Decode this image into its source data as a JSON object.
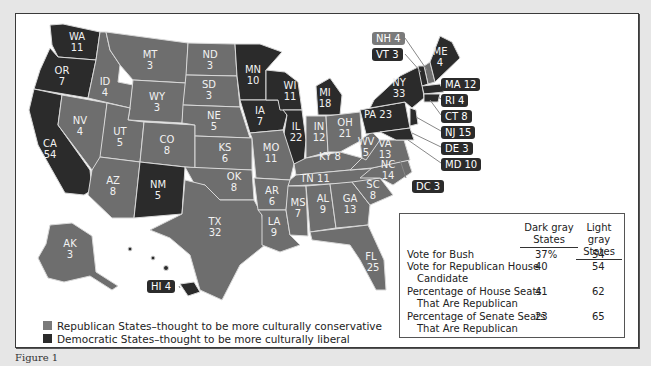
{
  "legend": {
    "republican": {
      "label": "Republican States–thought to be more culturally conservative",
      "color": "#6e6e6e"
    },
    "democratic": {
      "label": "Democratic States–thought to be more culturally liberal",
      "color": "#2b2b2b"
    }
  },
  "states": {
    "WA": {
      "abbr": "WA",
      "ev": "11",
      "party": "D"
    },
    "OR": {
      "abbr": "OR",
      "ev": "7",
      "party": "D"
    },
    "CA": {
      "abbr": "CA",
      "ev": "54",
      "party": "D"
    },
    "ID": {
      "abbr": "ID",
      "ev": "4",
      "party": "R"
    },
    "NV": {
      "abbr": "NV",
      "ev": "4",
      "party": "R"
    },
    "MT": {
      "abbr": "MT",
      "ev": "3",
      "party": "R"
    },
    "WY": {
      "abbr": "WY",
      "ev": "3",
      "party": "R"
    },
    "UT": {
      "abbr": "UT",
      "ev": "5",
      "party": "R"
    },
    "AZ": {
      "abbr": "AZ",
      "ev": "8",
      "party": "R"
    },
    "CO": {
      "abbr": "CO",
      "ev": "8",
      "party": "R"
    },
    "NM": {
      "abbr": "NM",
      "ev": "5",
      "party": "D"
    },
    "ND": {
      "abbr": "ND",
      "ev": "3",
      "party": "R"
    },
    "SD": {
      "abbr": "SD",
      "ev": "3",
      "party": "R"
    },
    "NE": {
      "abbr": "NE",
      "ev": "5",
      "party": "R"
    },
    "KS": {
      "abbr": "KS",
      "ev": "6",
      "party": "R"
    },
    "OK": {
      "abbr": "OK",
      "ev": "8",
      "party": "R"
    },
    "TX": {
      "abbr": "TX",
      "ev": "32",
      "party": "R"
    },
    "MN": {
      "abbr": "MN",
      "ev": "10",
      "party": "D"
    },
    "IA": {
      "abbr": "IA",
      "ev": "7",
      "party": "D"
    },
    "MO": {
      "abbr": "MO",
      "ev": "11",
      "party": "R"
    },
    "AR": {
      "abbr": "AR",
      "ev": "6",
      "party": "R"
    },
    "LA": {
      "abbr": "LA",
      "ev": "9",
      "party": "R"
    },
    "WI": {
      "abbr": "WI",
      "ev": "11",
      "party": "D"
    },
    "IL": {
      "abbr": "IL",
      "ev": "22",
      "party": "D"
    },
    "MI": {
      "abbr": "MI",
      "ev": "18",
      "party": "D"
    },
    "IN": {
      "abbr": "IN",
      "ev": "12",
      "party": "R"
    },
    "OH": {
      "abbr": "OH",
      "ev": "21",
      "party": "R"
    },
    "KY": {
      "abbr": "KY",
      "ev": "8",
      "party": "R"
    },
    "TN": {
      "abbr": "TN",
      "ev": "11",
      "party": "R"
    },
    "MS": {
      "abbr": "MS",
      "ev": "7",
      "party": "R"
    },
    "AL": {
      "abbr": "AL",
      "ev": "9",
      "party": "R"
    },
    "GA": {
      "abbr": "GA",
      "ev": "13",
      "party": "R"
    },
    "FL": {
      "abbr": "FL",
      "ev": "25",
      "party": "R"
    },
    "SC": {
      "abbr": "SC",
      "ev": "8",
      "party": "R"
    },
    "NC": {
      "abbr": "NC",
      "ev": "14",
      "party": "R"
    },
    "VA": {
      "abbr": "VA",
      "ev": "13",
      "party": "R"
    },
    "WV": {
      "abbr": "WV",
      "ev": "5",
      "party": "R"
    },
    "PA": {
      "abbr": "PA",
      "ev": "23",
      "party": "D"
    },
    "NY": {
      "abbr": "NY",
      "ev": "33",
      "party": "D"
    },
    "ME": {
      "abbr": "ME",
      "ev": "4",
      "party": "D"
    },
    "AK": {
      "abbr": "AK",
      "ev": "3",
      "party": "R"
    }
  },
  "callouts": {
    "NH": "NH  4",
    "VT": "VT  3",
    "MA": "MA 12",
    "RI": "RI   4",
    "CT": "CT  8",
    "NJ": "NJ  15",
    "DE": "DE  3",
    "MD": "MD 10",
    "DC": "DC  3",
    "HI": "HI  4"
  },
  "table": {
    "col1": [
      "Dark gray",
      "States"
    ],
    "col2": [
      "Light gray",
      "States"
    ],
    "rows": [
      {
        "label": [
          "Vote for Bush"
        ],
        "dark": "37%",
        "light": "54"
      },
      {
        "label": [
          "Vote for Republican House",
          "Candidate"
        ],
        "dark": "40",
        "light": "54"
      },
      {
        "label": [
          "Percentage of House Seats",
          "That Are Republican"
        ],
        "dark": "41",
        "light": "62"
      },
      {
        "label": [
          "Percentage of Senate Seats",
          "That Are Republican"
        ],
        "dark": "23",
        "light": "65"
      }
    ]
  },
  "caption": "Figure 1"
}
